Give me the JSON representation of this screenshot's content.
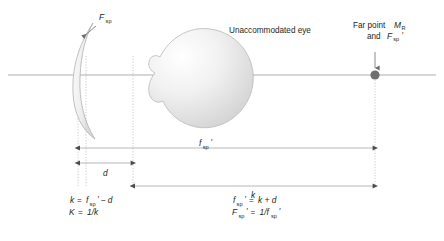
{
  "figure": {
    "type": "optics-ray-diagram",
    "title_text": "",
    "background_color": "#ffffff",
    "ink_color": "#231f20",
    "axis_color": "#9a9a9a",
    "guide_color": "#bdbdbd",
    "dot_color": "#6f6f6f"
  },
  "labels": {
    "spectacle_lens": {
      "base": "F",
      "sub": "sp",
      "prime": "",
      "full": "Fsp"
    },
    "eye": {
      "text": "Unaccommodated eye"
    },
    "far_point": {
      "line1_prefix": "Far point ",
      "line1_base": "M",
      "line1_sub": "R",
      "line2_prefix": "and ",
      "line2_base": "F",
      "line2_sub": "sp",
      "line2_prime": "′",
      "full": "Far point MR and Fsp′"
    }
  },
  "dimensions": {
    "d": {
      "symbol": "d",
      "description": "vertex distance from spectacle lens to eye"
    },
    "f_sp_prime": {
      "base": "f",
      "sub": "sp",
      "prime": "′",
      "full": "fsp′",
      "description": "secondary focal length of the spectacle lens"
    },
    "k": {
      "symbol": "k",
      "description": "ocular refractive distance to the far point"
    }
  },
  "equations": {
    "left": [
      {
        "lhs_base": "k",
        "lhs_sub": "",
        "lhs_prime": "",
        "eq": "=",
        "rhs_base": "f",
        "rhs_sub": "sp",
        "rhs_prime": "′",
        "rhs_tail": " − d",
        "full": "k = fsp′ − d"
      },
      {
        "lhs_base": "K",
        "lhs_sub": "",
        "lhs_prime": "",
        "eq": "=",
        "rhs_base": "",
        "rhs_sub": "",
        "rhs_prime": "",
        "rhs_tail": "1/k",
        "full": "K = 1/k"
      }
    ],
    "right": [
      {
        "lhs_base": "f",
        "lhs_sub": "sp",
        "lhs_prime": "′",
        "eq": "=",
        "rhs_base": "",
        "rhs_sub": "",
        "rhs_prime": "",
        "rhs_tail": "k + d",
        "full": "fsp′ = k + d"
      },
      {
        "lhs_base": "F",
        "lhs_sub": "sp",
        "lhs_prime": "′",
        "eq": "=",
        "rhs_base": "1/f",
        "rhs_sub": "sp",
        "rhs_prime": "′",
        "rhs_tail": "",
        "full": "Fsp′ = 1/fsp′"
      }
    ]
  },
  "glyphs": {
    "prime": "′",
    "minus": "−",
    "equals": "=",
    "plus": "+",
    "slash": "/"
  }
}
